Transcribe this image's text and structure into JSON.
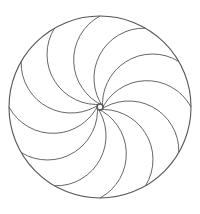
{
  "figure": {
    "type": "geometric-pinwheel",
    "background": "#ffffff",
    "stroke_color": "#555555",
    "outer_circle": {
      "cx": 100,
      "cy": 107,
      "r": 91
    },
    "arc_count": 12,
    "arc_radius": 50,
    "start_angle_deg": 0
  }
}
